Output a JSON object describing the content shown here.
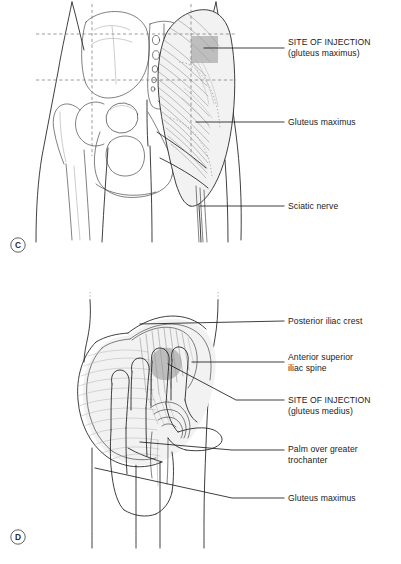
{
  "figure": {
    "background_color": "#ffffff",
    "ink_color": "#1d1d1d",
    "shading_color": "#9e9e9e",
    "guide_color": "#7b7b7b"
  },
  "panel_c": {
    "letter": "C",
    "view": "Posterior view of pelvis and gluteal region with quadrant guide lines",
    "labels": [
      {
        "id": "site-of-injection-gluteus-maximus",
        "line1": "SITE OF INJECTION",
        "line2": "(gluteus maximus)",
        "x": 288,
        "y": 47,
        "leader_from_x": 204,
        "leader_to_x": 284,
        "leader_y": 48
      },
      {
        "id": "gluteus-maximus",
        "line1": "Gluteus maximus",
        "line2": "",
        "x": 288,
        "y": 125,
        "leader_from_x": 196,
        "leader_to_x": 284,
        "leader_y": 122
      },
      {
        "id": "sciatic-nerve",
        "line1": "Sciatic nerve",
        "line2": "",
        "x": 288,
        "y": 209,
        "leader_from_x": 200,
        "leader_to_x": 284,
        "leader_y": 206
      }
    ]
  },
  "panel_d": {
    "letter": "D",
    "view": "Hand placed over greater trochanter locating the gluteus medius injection site",
    "labels": [
      {
        "id": "posterior-iliac-crest",
        "line1": "Posterior iliac crest",
        "line2": "",
        "x": 288,
        "y": 323,
        "leader_y": 321
      },
      {
        "id": "anterior-superior-iliac-spine",
        "line1": "Anterior superior",
        "line2": "iliac spine",
        "x": 288,
        "y": 363,
        "leader_y": 363
      },
      {
        "id": "site-of-injection-gluteus-medius",
        "line1": "SITE OF INJECTION",
        "line2": "(gluteus medius)",
        "x": 288,
        "y": 403,
        "leader_y": 403
      },
      {
        "id": "palm-over-greater-trochanter",
        "line1": "Palm over greater",
        "line2": "trochanter",
        "x": 288,
        "y": 452,
        "leader_y": 452
      },
      {
        "id": "gluteus-maximus",
        "line1": "Gluteus maximus",
        "line2": "",
        "x": 288,
        "y": 500,
        "leader_y": 500
      }
    ]
  },
  "caption": {
    "text": ""
  }
}
